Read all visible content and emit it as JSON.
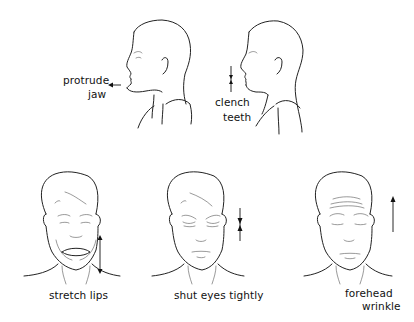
{
  "figure": {
    "panels": [
      {
        "id": "protrude-jaw",
        "view": "profile",
        "label_lines": [
          "protrude",
          "jaw"
        ],
        "arrow": "left"
      },
      {
        "id": "clench-teeth",
        "view": "profile",
        "label_lines": [
          "clench",
          "teeth"
        ],
        "arrow": "converging-vertical"
      },
      {
        "id": "stretch-lips",
        "view": "frontal",
        "label_lines": [
          "stretch lips"
        ],
        "arrow": "double-vertical"
      },
      {
        "id": "shut-eyes-tightly",
        "view": "frontal",
        "label_lines": [
          "shut eyes tightly"
        ],
        "arrow": "converging-vertical"
      },
      {
        "id": "forehead-wrinkle",
        "view": "frontal",
        "label_lines": [
          "forehead",
          "wrinkle"
        ],
        "arrow": "up"
      }
    ],
    "caption": ""
  }
}
